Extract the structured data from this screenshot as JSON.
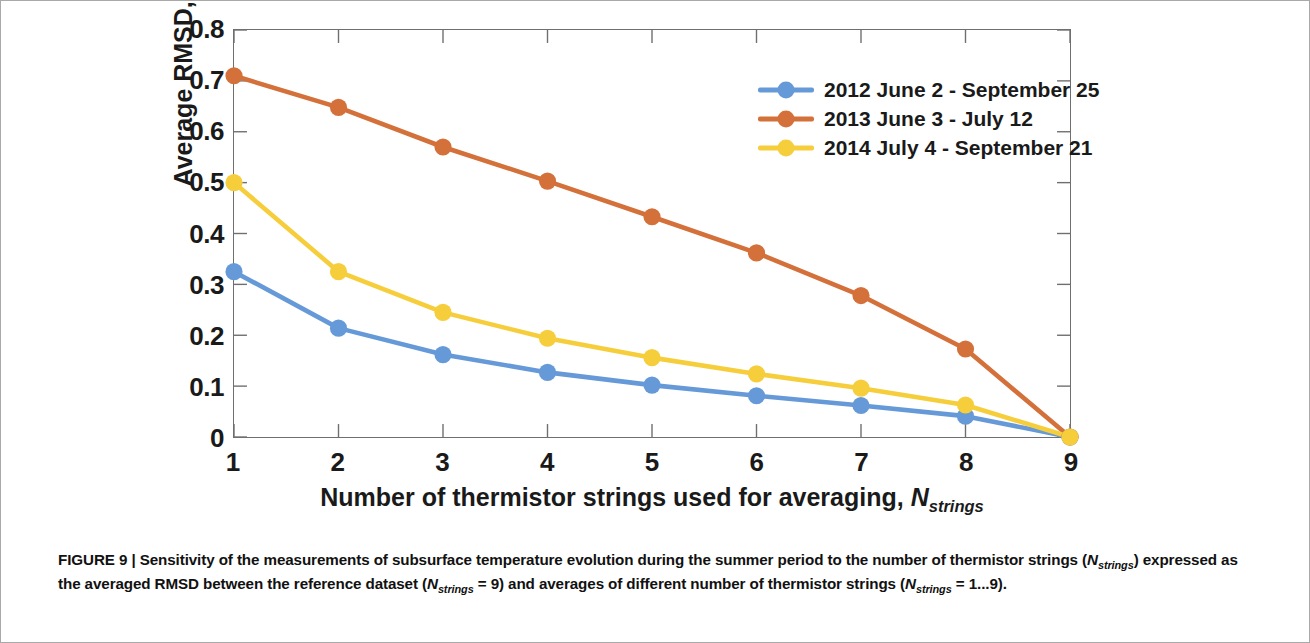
{
  "figure": {
    "caption_label": "FIGURE 9",
    "caption_separator": "|",
    "caption_part1": "Sensitivity of the measurements of subsurface temperature evolution during the summer period to the number of thermistor strings",
    "caption_part2_pre": "(",
    "caption_n1": "N",
    "caption_n1_sub": "strings",
    "caption_part2_mid": ") expressed as the averaged RMSD between the reference dataset (",
    "caption_n2": "N",
    "caption_n2_sub": "strings",
    "caption_part2_post": " = 9) and averages of different number of thermistor strings",
    "caption_part3_pre": "(",
    "caption_n3": "N",
    "caption_n3_sub": "strings",
    "caption_part3_post": " = 1...9)."
  },
  "axes": {
    "y_title_text": "Average RMSD, [°C]",
    "x_title_text": "Number of thermistor strings used for averaging, ",
    "x_title_symbol": "N",
    "x_title_symbol_sub": "strings"
  },
  "chart_data": {
    "type": "line",
    "title": "",
    "xlabel": "Number of thermistor strings used for averaging, N_strings",
    "ylabel": "Average RMSD, [°C]",
    "x": [
      1,
      2,
      3,
      4,
      5,
      6,
      7,
      8,
      9
    ],
    "xlim": [
      1,
      9
    ],
    "ylim": [
      0,
      0.8
    ],
    "xticks": [
      "1",
      "2",
      "3",
      "4",
      "5",
      "6",
      "7",
      "8",
      "9"
    ],
    "yticks": [
      "0",
      "0.1",
      "0.2",
      "0.3",
      "0.4",
      "0.5",
      "0.6",
      "0.7",
      "0.8"
    ],
    "ytick_values": [
      0,
      0.1,
      0.2,
      0.3,
      0.4,
      0.5,
      0.6,
      0.7,
      0.8
    ],
    "grid": false,
    "legend_position": "upper right",
    "series": [
      {
        "name": "2012 June 2 - September 25",
        "color": "#6699D8",
        "values": [
          0.325,
          0.214,
          0.162,
          0.127,
          0.102,
          0.081,
          0.062,
          0.041,
          0.0
        ]
      },
      {
        "name": "2013 June 3 - July 12",
        "color": "#D4703A",
        "values": [
          0.71,
          0.648,
          0.57,
          0.503,
          0.433,
          0.362,
          0.278,
          0.173,
          0.0
        ]
      },
      {
        "name": "2014 July 4 - September 21",
        "color": "#F6CE3C",
        "values": [
          0.5,
          0.325,
          0.245,
          0.194,
          0.156,
          0.124,
          0.096,
          0.063,
          0.0
        ]
      }
    ]
  }
}
